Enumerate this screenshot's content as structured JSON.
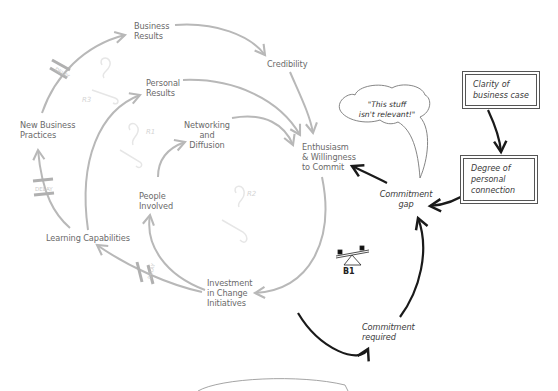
{
  "diagram": {
    "variables": {
      "business_results": "Business\nResults",
      "credibility": "Credibility",
      "personal_results": "Personal\nResults",
      "networking_diffusion": "Networking\nand\nDiffusion",
      "new_business_practices": "New Business\nPractices",
      "people_involved": "People\nInvolved",
      "learning_capabilities": "Learning Capabilities",
      "investment_change": "Investment\nin Change\nInitiatives",
      "enthusiasm": "Enthusiasm\n& Willingness\nto Commit",
      "commitment_gap": "Commitment\ngap",
      "commitment_required": "Commitment\nrequired"
    },
    "boxes": {
      "clarity": "Clarity of\nbusiness case",
      "degree": "Degree of\npersonal\nconnection"
    },
    "thought_bubble": "\"This stuff\nisn't relevant!\"",
    "loops": {
      "r1": "R1",
      "r2": "R2",
      "r3": "R3",
      "b1": "B1"
    },
    "delay_label": "DELAY",
    "colors": {
      "reinforcing_arrows": "#b8b8b8",
      "balancing_arrows": "#1a1a1a",
      "text_gray": "#6a6a6a",
      "box_border": "#555555"
    }
  }
}
